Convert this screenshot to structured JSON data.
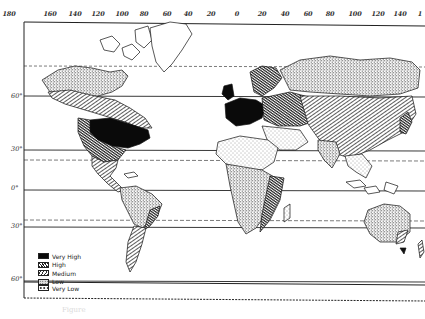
{
  "figure": {
    "type": "world-map",
    "caption": "Figure"
  },
  "longitude_labels": [
    "180",
    "160",
    "140",
    "120",
    "100",
    "80",
    "60",
    "40",
    "20",
    "0",
    "20",
    "40",
    "60",
    "80",
    "100",
    "120",
    "140",
    "1"
  ],
  "latitude_labels": [
    "60°",
    "30°",
    "0°",
    "30°",
    "60°"
  ],
  "legend": {
    "title": "",
    "items": [
      {
        "label": "Very High",
        "pattern": "solid-black"
      },
      {
        "label": "High",
        "pattern": "dense-hatch"
      },
      {
        "label": "Medium",
        "pattern": "diagonal-hatch"
      },
      {
        "label": "Low",
        "pattern": "stipple-dark"
      },
      {
        "label": "Very Low",
        "pattern": "stipple-light"
      }
    ]
  },
  "colors": {
    "ink": "#111111",
    "paper": "#ffffff",
    "grid": "#222222"
  }
}
